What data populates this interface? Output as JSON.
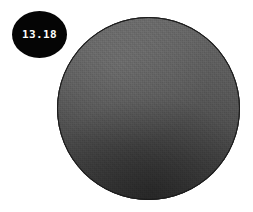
{
  "canvas": {
    "width": 253,
    "height": 212,
    "background_color": "#ffffff"
  },
  "annotations": [
    {
      "name": "measurement-badge",
      "value": "13.18",
      "shape": "ellipse",
      "background_color": "#050505",
      "text_color": "#ffffff",
      "position": {
        "x": 12,
        "y": 11,
        "width": 55,
        "height": 47
      }
    }
  ],
  "object": {
    "name": "circular-specimen",
    "shape": "circle",
    "fill_top_color": "#666666",
    "fill_bottom_color": "#3a3a3a",
    "outline_color": "#1c1c1c",
    "position": {
      "x": 57,
      "y": 17,
      "width": 183,
      "height": 183
    }
  }
}
